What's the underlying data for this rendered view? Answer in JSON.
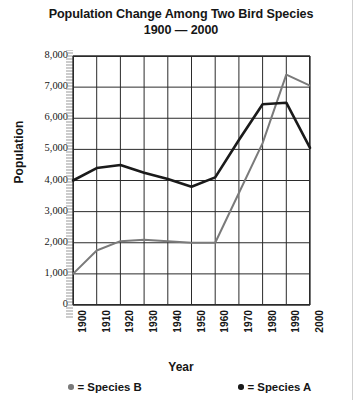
{
  "title": {
    "line1": "Population Change Among Two Bird Species",
    "line2": "1900 — 2000"
  },
  "axes": {
    "ylabel": "Population",
    "xlabel": "Year"
  },
  "legend": {
    "items": [
      {
        "name": "species-b",
        "marker": "●",
        "text": "= Species B",
        "color": "#7a7a7a"
      },
      {
        "name": "species-a",
        "marker": "●",
        "text": "= Species A",
        "color": "#1a1a1a"
      }
    ]
  },
  "chart_data": {
    "type": "line",
    "title": "Population Change Among Two Bird Species 1900 — 2000",
    "xlabel": "Year",
    "ylabel": "Population",
    "x": [
      1900,
      1910,
      1920,
      1930,
      1940,
      1950,
      1960,
      1970,
      1980,
      1990,
      2000
    ],
    "xtick_labels": [
      "1900",
      "1910",
      "1920",
      "1930",
      "1940",
      "1950",
      "1960",
      "1970",
      "1980",
      "1990",
      "2000"
    ],
    "ytick_labels": [
      "8,000",
      "7,000",
      "6,000",
      "5,000",
      "4,000",
      "3,000",
      "2,000",
      "1,000",
      "0"
    ],
    "yticks": [
      8000,
      7000,
      6000,
      5000,
      4000,
      3000,
      2000,
      1000,
      0
    ],
    "xlim": [
      1900,
      2000
    ],
    "ylim": [
      0,
      8000
    ],
    "grid": true,
    "legend_position": "bottom",
    "series": [
      {
        "name": "Species A",
        "color": "#1a1a1a",
        "values": [
          4000,
          4400,
          4500,
          4250,
          4050,
          3800,
          4100,
          5300,
          6450,
          6500,
          5050
        ]
      },
      {
        "name": "Species B",
        "color": "#7a7a7a",
        "values": [
          1000,
          1750,
          2050,
          2100,
          2050,
          2000,
          2000,
          3600,
          5200,
          7400,
          7050
        ]
      }
    ]
  }
}
